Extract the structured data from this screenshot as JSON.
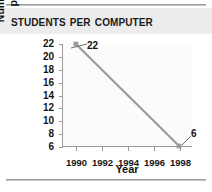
{
  "chart_data": {
    "type": "line",
    "title": "Students per Computer",
    "xlabel": "Year",
    "ylabel": "Number of Students per Computer",
    "ylabel_lines": [
      "Number of Students",
      "per Computer"
    ],
    "x": [
      1990,
      1998
    ],
    "values": [
      22,
      6
    ],
    "point_labels": [
      "22",
      "6"
    ],
    "xlim": [
      1989,
      1999
    ],
    "ylim": [
      6,
      22
    ],
    "xticks": [
      1990,
      1992,
      1994,
      1996,
      1998
    ],
    "xtick_labels": [
      "1990",
      "1992",
      "1994",
      "1996",
      "1998"
    ],
    "yticks": [
      6,
      8,
      10,
      12,
      14,
      16,
      18,
      20,
      22
    ],
    "ytick_labels": [
      "6",
      "8",
      "10",
      "12",
      "14",
      "16",
      "18",
      "20",
      "22"
    ],
    "grid": false,
    "legend": null,
    "series_color": "#9b9b9b",
    "marker_color": "#9b9b9b",
    "axis_color": "#9a9a9a",
    "text_color": "#161616",
    "title_band_color": "#ececec",
    "plot_background": "#fbfbfb",
    "rule_color": "#9a9a9a"
  }
}
